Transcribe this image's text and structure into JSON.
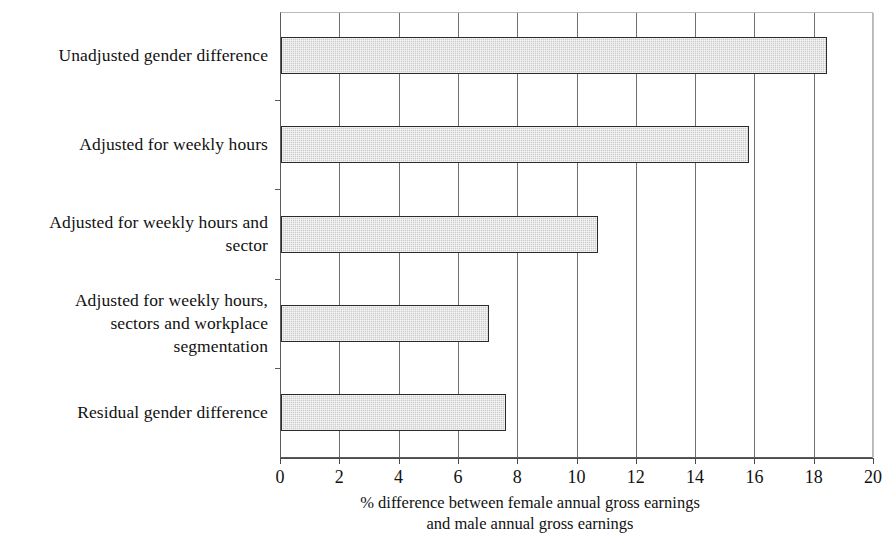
{
  "chart_data": {
    "type": "bar",
    "orientation": "horizontal",
    "title": "",
    "subtitle": "",
    "categories": [
      "Unadjusted gender difference",
      "Adjusted for weekly hours",
      "Adjusted for weekly hours and sector",
      "Adjusted for weekly hours, sectors and workplace segmentation",
      "Residual gender difference"
    ],
    "category_lines": [
      [
        "Unadjusted gender difference"
      ],
      [
        "Adjusted for weekly hours"
      ],
      [
        "Adjusted for weekly hours and",
        "sector"
      ],
      [
        "Adjusted for weekly hours,",
        "sectors and workplace",
        "segmentation"
      ],
      [
        "Residual gender difference"
      ]
    ],
    "values": [
      18.4,
      15.8,
      10.7,
      7.0,
      7.6
    ],
    "xlabel_lines": [
      "% difference between female annual gross earnings",
      "and male annual gross earnings"
    ],
    "xlabel": "% difference between female annual gross earnings and male annual gross earnings",
    "ylabel": "",
    "xlim": [
      0,
      20
    ],
    "xticks": [
      0,
      2,
      4,
      6,
      8,
      10,
      12,
      14,
      16,
      18,
      20
    ],
    "xtick_labels": [
      "0",
      "2",
      "4",
      "6",
      "8",
      "10",
      "12",
      "14",
      "16",
      "18",
      "20"
    ],
    "grid": "vertical",
    "legend": "none",
    "bar_fill_color": "#cccccc",
    "bar_border_color": "#2b2b2b",
    "gridline_color": "#6f6f6f",
    "axis_color": "#4a4a4a",
    "text_color": "#111111"
  }
}
